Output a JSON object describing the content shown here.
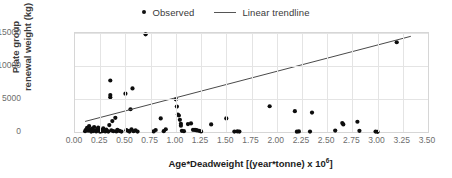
{
  "legend": {
    "position": "top-center",
    "entries": [
      {
        "label": "Observed",
        "marker": "dot",
        "color": "#0d0d0d"
      },
      {
        "label": "Linear trendline",
        "marker": "line",
        "color": "#4a4a4a"
      }
    ]
  },
  "chart_data": {
    "type": "scatter",
    "title": "",
    "xlabel": "Age*Deadweight [(year*tonne) x 10",
    "xlabel_exponent": "6",
    "xlabel_suffix": "]",
    "ylabel_line1": "Plate group",
    "ylabel_line2": "renewal weight (kg)",
    "xlim": [
      0.0,
      3.5
    ],
    "ylim": [
      0,
      15000
    ],
    "xticks": [
      "0.00",
      "0.25",
      "0.50",
      "0.75",
      "1.00",
      "1.25",
      "1.50",
      "1.75",
      "2.00",
      "2.25",
      "2.50",
      "2.75",
      "3.00",
      "3.25",
      "3.50"
    ],
    "xtick_values": [
      0.0,
      0.25,
      0.5,
      0.75,
      1.0,
      1.25,
      1.5,
      1.75,
      2.0,
      2.25,
      2.5,
      2.75,
      3.0,
      3.25,
      3.5
    ],
    "yticks": [
      "0",
      "5000",
      "10000",
      "15000"
    ],
    "ytick_values": [
      0,
      5000,
      10000,
      15000
    ],
    "grid": true,
    "grid_color": "#e4e4e4",
    "series": [
      {
        "name": "Observed",
        "marker_color": "#0d0d0d",
        "points": [
          [
            0.1,
            120
          ],
          [
            0.11,
            380
          ],
          [
            0.12,
            640
          ],
          [
            0.13,
            200
          ],
          [
            0.14,
            900
          ],
          [
            0.15,
            350
          ],
          [
            0.16,
            60
          ],
          [
            0.17,
            520
          ],
          [
            0.18,
            140
          ],
          [
            0.19,
            760
          ],
          [
            0.2,
            230
          ],
          [
            0.21,
            90
          ],
          [
            0.22,
            430
          ],
          [
            0.23,
            660
          ],
          [
            0.24,
            180
          ],
          [
            0.25,
            50
          ],
          [
            0.26,
            300
          ],
          [
            0.27,
            120
          ],
          [
            0.28,
            540
          ],
          [
            0.29,
            200
          ],
          [
            0.3,
            90
          ],
          [
            0.31,
            380
          ],
          [
            0.32,
            150
          ],
          [
            0.33,
            60
          ],
          [
            0.34,
            1050
          ],
          [
            0.35,
            7800
          ],
          [
            0.35,
            5600
          ],
          [
            0.35,
            5250
          ],
          [
            0.36,
            260
          ],
          [
            0.37,
            1650
          ],
          [
            0.38,
            120
          ],
          [
            0.4,
            2150
          ],
          [
            0.41,
            80
          ],
          [
            0.42,
            340
          ],
          [
            0.44,
            170
          ],
          [
            0.46,
            60
          ],
          [
            0.5,
            5800
          ],
          [
            0.51,
            280
          ],
          [
            0.53,
            150
          ],
          [
            0.54,
            70
          ],
          [
            0.55,
            3450
          ],
          [
            0.56,
            420
          ],
          [
            0.57,
            6600
          ],
          [
            0.58,
            110
          ],
          [
            0.6,
            240
          ],
          [
            0.62,
            60
          ],
          [
            0.7,
            14800
          ],
          [
            0.78,
            80
          ],
          [
            0.8,
            300
          ],
          [
            0.85,
            2050
          ],
          [
            0.88,
            120
          ],
          [
            0.9,
            420
          ],
          [
            1.0,
            4950
          ],
          [
            1.01,
            3850
          ],
          [
            1.02,
            2650
          ],
          [
            1.03,
            2500
          ],
          [
            1.04,
            1850
          ],
          [
            1.05,
            1250
          ],
          [
            1.05,
            950
          ],
          [
            1.06,
            180
          ],
          [
            1.08,
            120
          ],
          [
            1.12,
            1200
          ],
          [
            1.15,
            1300
          ],
          [
            1.17,
            330
          ],
          [
            1.19,
            320
          ],
          [
            1.2,
            280
          ],
          [
            1.21,
            250
          ],
          [
            1.23,
            180
          ],
          [
            1.25,
            90
          ],
          [
            1.35,
            1150
          ],
          [
            1.5,
            2050
          ],
          [
            1.58,
            60
          ],
          [
            1.61,
            80
          ],
          [
            1.63,
            60
          ],
          [
            1.93,
            3900
          ],
          [
            2.18,
            3150
          ],
          [
            2.2,
            50
          ],
          [
            2.22,
            80
          ],
          [
            2.33,
            70
          ],
          [
            2.35,
            2950
          ],
          [
            2.58,
            220
          ],
          [
            2.65,
            1350
          ],
          [
            2.66,
            1150
          ],
          [
            2.8,
            1550
          ],
          [
            2.82,
            180
          ],
          [
            2.98,
            60
          ],
          [
            3.0,
            30
          ],
          [
            3.19,
            13600
          ]
        ]
      }
    ],
    "trendline": {
      "name": "Linear trendline",
      "color": "#4a4a4a",
      "x_start": 0.1,
      "y_start": 1600,
      "x_end": 3.33,
      "y_end": 14500
    }
  }
}
